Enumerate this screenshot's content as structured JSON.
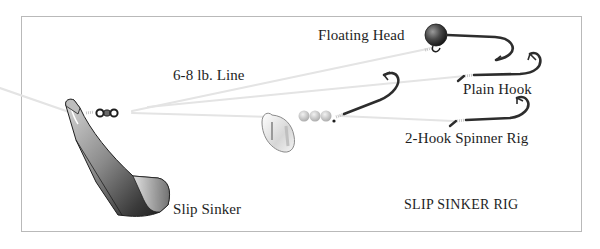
{
  "diagram": {
    "title": "SLIP SINKER RIG",
    "labels": {
      "floating_head": "Floating Head",
      "line": "6-8 lb. Line",
      "plain_hook": "Plain Hook",
      "spinner_rig": "2-Hook Spinner Rig",
      "slip_sinker": "Slip Sinker"
    },
    "components": [
      {
        "name": "slip-sinker",
        "label": "Slip Sinker"
      },
      {
        "name": "barrel-swivel",
        "label": ""
      },
      {
        "name": "line",
        "label": "6-8 lb. Line"
      },
      {
        "name": "floating-head-jig",
        "label": "Floating Head"
      },
      {
        "name": "plain-hook",
        "label": "Plain Hook"
      },
      {
        "name": "spinner-rig",
        "label": "2-Hook Spinner Rig"
      }
    ],
    "colors": {
      "border": "#b9b9b9",
      "line": "#e2e2e2",
      "hook": "#2d2d2d",
      "text": "#1e1e1e"
    }
  }
}
